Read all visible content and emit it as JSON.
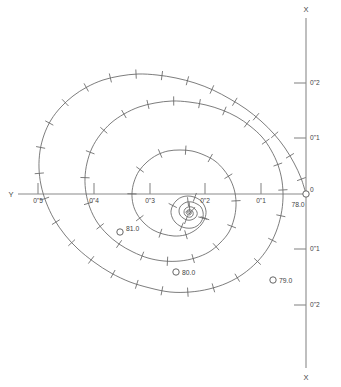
{
  "figure": {
    "type": "apparent-orbit-diagram",
    "background_color": "#ffffff",
    "curve_color": "#666666",
    "axis_color": "#8a8a8a",
    "text_color": "#444444"
  },
  "axes": {
    "vertical": {
      "name_top": "X",
      "name_bottom": "X",
      "origin_label": "0",
      "ticks_above": [
        "0\"1",
        "0\"2"
      ],
      "ticks_below": [
        "0\"1",
        "0\"2"
      ]
    },
    "horizontal": {
      "name_left": "Y",
      "ticks": [
        "0\"5",
        "0\"4",
        "0\"3",
        "0\"2",
        "0\"1"
      ]
    }
  },
  "epochs": [
    {
      "label": "78.0",
      "marker": "open-circle"
    },
    {
      "label": "79.0",
      "marker": "open-circle"
    },
    {
      "label": "80.0",
      "marker": "open-circle"
    },
    {
      "label": "81.0",
      "marker": "open-circle"
    }
  ],
  "chart_data": {
    "type": "line",
    "title": "",
    "xlabel": "Y",
    "ylabel": "X",
    "grid": false,
    "legend": "none",
    "unit": "arcsec",
    "axis_origin_px": [
      306,
      194
    ],
    "px_per_unit_x": 55.5,
    "px_per_unit_y": 55.5,
    "x_tick_values_above": [
      0.1,
      0.2
    ],
    "x_tick_values_below": [
      -0.1,
      -0.2
    ],
    "y_tick_values": [
      0.5,
      0.4,
      0.3,
      0.2,
      0.1
    ],
    "xlim": [
      -0.33,
      0.26
    ],
    "ylim": [
      -0.02,
      0.56
    ],
    "series": [
      {
        "name": "apparent-orbit-spiral",
        "comment": "Spiralling relative position, epoch 78.0 at origin outward-inward; sampled as screen px path",
        "points_px": [
          [
            306,
            194
          ],
          [
            301,
            178
          ],
          [
            294,
            163
          ],
          [
            285,
            148
          ],
          [
            274,
            134
          ],
          [
            261,
            121
          ],
          [
            246,
            109
          ],
          [
            230,
            99
          ],
          [
            213,
            90
          ],
          [
            195,
            83
          ],
          [
            176,
            78
          ],
          [
            157,
            75
          ],
          [
            138,
            74
          ],
          [
            120,
            76
          ],
          [
            103,
            80
          ],
          [
            87,
            87
          ],
          [
            73,
            96
          ],
          [
            61,
            107
          ],
          [
            51,
            120
          ],
          [
            44,
            135
          ],
          [
            40,
            151
          ],
          [
            39,
            168
          ],
          [
            41,
            185
          ],
          [
            46,
            202
          ],
          [
            54,
            219
          ],
          [
            65,
            235
          ],
          [
            78,
            249
          ],
          [
            94,
            262
          ],
          [
            111,
            273
          ],
          [
            130,
            282
          ],
          [
            150,
            288
          ],
          [
            170,
            292
          ],
          [
            190,
            292
          ],
          [
            209,
            289
          ],
          [
            227,
            283
          ],
          [
            243,
            274
          ],
          [
            257,
            262
          ],
          [
            268,
            248
          ],
          [
            276,
            232
          ],
          [
            281,
            215
          ],
          [
            283,
            198
          ],
          [
            282,
            181
          ],
          [
            278,
            165
          ],
          [
            271,
            150
          ],
          [
            262,
            137
          ],
          [
            250,
            126
          ],
          [
            237,
            117
          ],
          [
            222,
            110
          ],
          [
            206,
            105
          ],
          [
            189,
            102
          ],
          [
            172,
            101
          ],
          [
            155,
            103
          ],
          [
            139,
            107
          ],
          [
            124,
            114
          ],
          [
            111,
            123
          ],
          [
            100,
            135
          ],
          [
            92,
            148
          ],
          [
            87,
            163
          ],
          [
            85,
            178
          ],
          [
            86,
            193
          ],
          [
            90,
            208
          ],
          [
            97,
            222
          ],
          [
            107,
            234
          ],
          [
            119,
            244
          ],
          [
            133,
            252
          ],
          [
            148,
            258
          ],
          [
            164,
            261
          ],
          [
            180,
            261
          ],
          [
            195,
            258
          ],
          [
            209,
            252
          ],
          [
            220,
            243
          ],
          [
            229,
            232
          ],
          [
            234,
            219
          ],
          [
            236,
            206
          ],
          [
            235,
            193
          ],
          [
            231,
            181
          ],
          [
            224,
            170
          ],
          [
            215,
            161
          ],
          [
            204,
            155
          ],
          [
            192,
            151
          ],
          [
            180,
            150
          ],
          [
            168,
            151
          ],
          [
            157,
            155
          ],
          [
            147,
            162
          ],
          [
            139,
            171
          ],
          [
            134,
            182
          ],
          [
            132,
            193
          ],
          [
            133,
            204
          ],
          [
            137,
            214
          ],
          [
            144,
            223
          ],
          [
            153,
            230
          ],
          [
            163,
            234
          ],
          [
            174,
            236
          ],
          [
            185,
            235
          ],
          [
            194,
            231
          ],
          [
            201,
            225
          ],
          [
            205,
            218
          ],
          [
            206,
            211
          ],
          [
            204,
            205
          ],
          [
            200,
            200
          ],
          [
            194,
            197
          ],
          [
            188,
            196
          ],
          [
            182,
            197
          ],
          [
            177,
            200
          ],
          [
            173,
            205
          ],
          [
            171,
            211
          ],
          [
            172,
            217
          ],
          [
            175,
            222
          ],
          [
            180,
            226
          ],
          [
            186,
            228
          ],
          [
            192,
            228
          ],
          [
            197,
            226
          ],
          [
            201,
            222
          ],
          [
            203,
            217
          ],
          [
            203,
            212
          ],
          [
            201,
            207
          ],
          [
            197,
            204
          ],
          [
            192,
            202
          ],
          [
            187,
            202
          ],
          [
            183,
            204
          ],
          [
            180,
            207
          ],
          [
            179,
            211
          ],
          [
            180,
            215
          ],
          [
            183,
            218
          ],
          [
            187,
            220
          ],
          [
            191,
            220
          ],
          [
            195,
            218
          ],
          [
            197,
            215
          ],
          [
            197,
            212
          ],
          [
            195,
            209
          ],
          [
            192,
            207
          ],
          [
            188,
            207
          ],
          [
            185,
            209
          ],
          [
            184,
            212
          ],
          [
            185,
            215
          ],
          [
            188,
            217
          ],
          [
            191,
            217
          ],
          [
            193,
            215
          ],
          [
            193,
            212
          ],
          [
            191,
            210
          ],
          [
            188,
            210
          ],
          [
            186,
            212
          ],
          [
            187,
            214
          ],
          [
            189,
            215
          ],
          [
            191,
            214
          ],
          [
            191,
            212
          ],
          [
            189,
            211
          ],
          [
            187,
            212
          ],
          [
            188,
            213
          ],
          [
            190,
            213
          ]
        ]
      }
    ],
    "annotations": [
      {
        "text": "78.0",
        "at_px": [
          306,
          194
        ]
      },
      {
        "text": "79.0",
        "at_px": [
          273,
          280
        ]
      },
      {
        "text": "80.0",
        "at_px": [
          176,
          272
        ]
      },
      {
        "text": "81.0",
        "at_px": [
          120,
          232
        ]
      }
    ]
  }
}
